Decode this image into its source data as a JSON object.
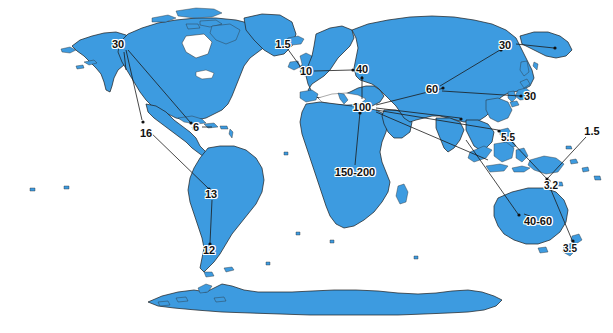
{
  "figure": {
    "type": "annotated-world-map",
    "title": "",
    "projection": "world-flat",
    "ocean_color": "#ffffff",
    "land_color": "#3d9be0",
    "land_outline_color": "#1a1a1a",
    "annotation_text_color": "#111111",
    "leader_line_color": "#1a1a1a",
    "width": 613,
    "height": 333
  },
  "annotations": [
    {
      "id": "alaska",
      "label": "30",
      "region": "Alaska / Northwest North America",
      "x": 118,
      "y": 44
    },
    {
      "id": "mexico",
      "label": "16",
      "region": "Mexico / Central America",
      "x": 146,
      "y": 133
    },
    {
      "id": "caribbean",
      "label": "6",
      "region": "Caribbean",
      "x": 196,
      "y": 127
    },
    {
      "id": "brazil",
      "label": "13",
      "region": "South America (Brazil)",
      "x": 211,
      "y": 194
    },
    {
      "id": "patagonia",
      "label": "12",
      "region": "Southern South America",
      "x": 209,
      "y": 250
    },
    {
      "id": "iceland",
      "label": "1.5",
      "region": "Iceland / North Atlantic",
      "x": 283,
      "y": 44
    },
    {
      "id": "britain",
      "label": "10",
      "region": "British Isles",
      "x": 306,
      "y": 71
    },
    {
      "id": "europe",
      "label": "40",
      "region": "Central Europe",
      "x": 362,
      "y": 69
    },
    {
      "id": "mediterranean",
      "label": "100",
      "region": "Eastern Mediterranean / Middle East",
      "x": 362,
      "y": 107
    },
    {
      "id": "africa",
      "label": "150-200",
      "region": "Sub-Saharan Africa",
      "x": 355,
      "y": 172
    },
    {
      "id": "central-asia",
      "label": "60",
      "region": "Central Asia",
      "x": 432,
      "y": 89
    },
    {
      "id": "kamchatka",
      "label": "30",
      "region": "Russian Far East",
      "x": 505,
      "y": 45
    },
    {
      "id": "japan",
      "label": "30",
      "region": "Japan",
      "x": 530,
      "y": 96
    },
    {
      "id": "philippines",
      "label": "5.5",
      "region": "Philippines",
      "x": 508,
      "y": 138
    },
    {
      "id": "new-guinea",
      "label": "3.2",
      "region": "New Guinea",
      "x": 551,
      "y": 186
    },
    {
      "id": "pacific",
      "label": "1.5",
      "region": "Western Pacific Islands",
      "x": 592,
      "y": 131
    },
    {
      "id": "australia",
      "label": "40-60",
      "region": "Australia",
      "x": 538,
      "y": 221
    },
    {
      "id": "new-zealand",
      "label": "3.5",
      "region": "New Zealand",
      "x": 570,
      "y": 249
    }
  ]
}
